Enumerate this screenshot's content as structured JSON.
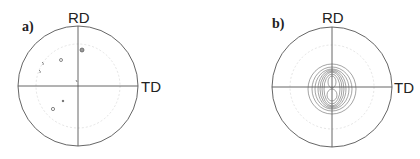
{
  "panels": [
    {
      "label": "a)",
      "rd": "RD",
      "td": "TD"
    },
    {
      "label": "b)",
      "rd": "RD",
      "td": "TD"
    }
  ],
  "colors": {
    "line": "#555555",
    "dash": "#dddddd",
    "contour": "#666666"
  }
}
